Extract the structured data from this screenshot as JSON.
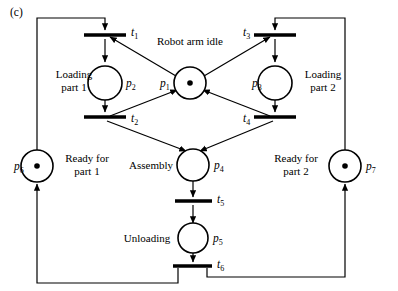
{
  "figure": {
    "panel_label": "(c)",
    "caption_text": ""
  },
  "places": [
    {
      "id": "p1",
      "id_base": "p",
      "id_sub": "1",
      "label": "Robot arm idle",
      "tokens": 1,
      "cx": 190,
      "cy": 83,
      "r": 16,
      "id_x": 160,
      "id_y": 87,
      "label_x": 190,
      "label_y": 45,
      "label_anchor": "middle"
    },
    {
      "id": "p2",
      "id_base": "p",
      "id_sub": "2",
      "label_line1": "Loading",
      "label_line2": "part 1",
      "tokens": 0,
      "cx": 105,
      "cy": 83,
      "r": 17,
      "id_x": 126,
      "id_y": 87,
      "label_x": 74,
      "label_y": 78,
      "label_anchor": "middle"
    },
    {
      "id": "p3",
      "id_base": "p",
      "id_sub": "3",
      "label_line1": "Loading",
      "label_line2": "part 2",
      "tokens": 0,
      "cx": 275,
      "cy": 83,
      "r": 17,
      "id_x": 252,
      "id_y": 87,
      "label_x": 323,
      "label_y": 78,
      "label_anchor": "middle"
    },
    {
      "id": "p4",
      "id_base": "p",
      "id_sub": "4",
      "label": "Assembly",
      "tokens": 0,
      "cx": 193,
      "cy": 165,
      "r": 16,
      "id_x": 214,
      "id_y": 169,
      "label_x": 151,
      "label_y": 169,
      "label_anchor": "middle"
    },
    {
      "id": "p5",
      "id_base": "p",
      "id_sub": "5",
      "label": "Unloading",
      "tokens": 0,
      "cx": 193,
      "cy": 238,
      "r": 15,
      "id_x": 213,
      "id_y": 242,
      "label_x": 147,
      "label_y": 242,
      "label_anchor": "middle"
    },
    {
      "id": "p6",
      "id_base": "p",
      "id_sub": "6",
      "label_line1": "Ready for",
      "label_line2": "part 1",
      "tokens": 1,
      "cx": 37,
      "cy": 166,
      "r": 16,
      "id_x": 14,
      "id_y": 170,
      "label_x": 87,
      "label_y": 162,
      "label_anchor": "middle"
    },
    {
      "id": "p7",
      "id_base": "p",
      "id_sub": "7",
      "label_line1": "Ready for",
      "label_line2": "part 2",
      "tokens": 1,
      "cx": 345,
      "cy": 166,
      "r": 16,
      "id_x": 366,
      "id_y": 170,
      "label_x": 296,
      "label_y": 162,
      "label_anchor": "middle"
    }
  ],
  "transitions": [
    {
      "id": "t1",
      "id_base": "t",
      "id_sub": "1",
      "x1": 84,
      "x2": 126,
      "y": 35,
      "id_x": 131,
      "id_y": 36
    },
    {
      "id": "t2",
      "id_base": "t",
      "id_sub": "2",
      "x1": 84,
      "x2": 126,
      "y": 117,
      "id_x": 131,
      "id_y": 122
    },
    {
      "id": "t3",
      "id_base": "t",
      "id_sub": "3",
      "x1": 254,
      "x2": 296,
      "y": 35,
      "id_x": 243,
      "id_y": 36
    },
    {
      "id": "t4",
      "id_base": "t",
      "id_sub": "4",
      "x1": 254,
      "x2": 296,
      "y": 117,
      "id_x": 243,
      "id_y": 122
    },
    {
      "id": "t5",
      "id_base": "t",
      "id_sub": "5",
      "x1": 175,
      "x2": 212,
      "y": 201,
      "id_x": 217,
      "id_y": 203
    },
    {
      "id": "t6",
      "id_base": "t",
      "id_sub": "6",
      "x1": 173,
      "x2": 212,
      "y": 266,
      "id_x": 217,
      "id_y": 268
    }
  ],
  "arcs": [
    {
      "name": "p6-to-t1",
      "d": "M 37 150 L 37 18 L 105 18 L 105 30"
    },
    {
      "name": "t1-to-p2",
      "d": "M 105 39 L 105 62"
    },
    {
      "name": "p2-to-t2",
      "d": "M 105 100 L 105 112"
    },
    {
      "name": "p1-to-t1",
      "d": "M 176 76 L 110 37"
    },
    {
      "name": "t2-to-p1",
      "d": "M 110 116 L 177 90"
    },
    {
      "name": "p7-to-t3",
      "d": "M 345 150 L 345 18 L 275 18 L 275 30"
    },
    {
      "name": "t3-to-p3",
      "d": "M 275 39 L 275 62"
    },
    {
      "name": "p3-to-t4",
      "d": "M 275 100 L 275 112"
    },
    {
      "name": "p1-to-t3",
      "d": "M 204 76 L 270 37"
    },
    {
      "name": "t4-to-p1",
      "d": "M 270 116 L 203 90"
    },
    {
      "name": "t2-to-p4",
      "d": "M 107 121 L 186 151"
    },
    {
      "name": "t4-to-p4",
      "d": "M 273 121 L 200 151"
    },
    {
      "name": "p4-to-t5",
      "d": "M 193 181 L 193 197"
    },
    {
      "name": "t5-to-p5",
      "d": "M 193 205 L 193 223"
    },
    {
      "name": "p5-to-t6",
      "d": "M 193 253 L 193 262"
    },
    {
      "name": "t6-to-p6",
      "d": "M 178 268 L 178 283 L 37 283 L 37 184"
    },
    {
      "name": "t6-to-p7",
      "d": "M 207 268 L 207 277 L 345 277 L 345 184"
    }
  ],
  "legend": {
    "token_color": "#000000",
    "line_color": "#000000",
    "background": "#ffffff"
  },
  "net_info": {
    "type": "petri-net",
    "place_count": 7,
    "transition_count": 6,
    "initial_marking": "p1=1, p6=1, p7=1"
  }
}
